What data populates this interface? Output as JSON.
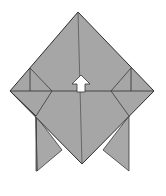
{
  "diagram": {
    "type": "origami-step",
    "colors": {
      "paper": "#a6a6a6",
      "paper_shadow": "#9a9a9a",
      "line": "#3a3a3a",
      "arrow_fill": "#ffffff",
      "background": "#ffffff"
    },
    "arrow": {
      "direction": "up",
      "icon": "arrow-up-icon"
    }
  }
}
